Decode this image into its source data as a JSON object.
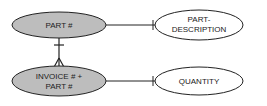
{
  "diagram": {
    "type": "entity-relationship",
    "nodes": [
      {
        "id": "part",
        "lines": [
          "PART #"
        ],
        "fill": "#bdbdbd"
      },
      {
        "id": "invoice_part",
        "lines": [
          "INVOICE # +",
          "PART #"
        ],
        "fill": "#bdbdbd"
      },
      {
        "id": "part_description",
        "lines": [
          "PART-",
          "DESCRIPTION"
        ],
        "fill": "#ffffff"
      },
      {
        "id": "quantity",
        "lines": [
          "QUANTITY"
        ],
        "fill": "#ffffff"
      }
    ],
    "edges": [
      {
        "from": "part",
        "to": "part_description",
        "end": "one"
      },
      {
        "from": "invoice_part",
        "to": "quantity",
        "end": "one"
      },
      {
        "from": "part",
        "to": "invoice_part",
        "start": "one",
        "end": "many"
      }
    ]
  }
}
